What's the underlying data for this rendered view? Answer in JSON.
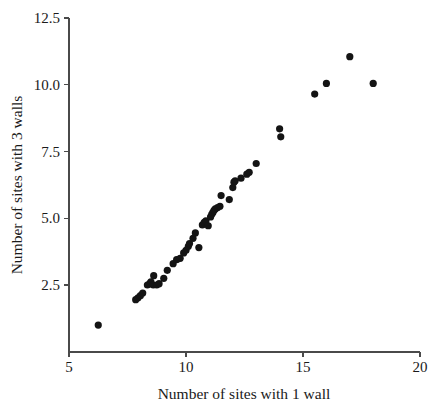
{
  "chart_data": {
    "type": "scatter",
    "title": "",
    "xlabel": "Number of sites with 1 wall",
    "ylabel": "Number of sites with 3 walls",
    "xlim": [
      5,
      20
    ],
    "ylim": [
      1.0,
      12.5
    ],
    "xticks": [
      5,
      10,
      15,
      20
    ],
    "xtick_labels": [
      "5",
      "10",
      "15",
      "20"
    ],
    "yticks": [
      2.5,
      5.0,
      7.5,
      10.0,
      12.5
    ],
    "ytick_labels": [
      "2.5",
      "5.0",
      "7.5",
      "10.0",
      "12.5"
    ],
    "grid": false,
    "legend": null,
    "marker": "filled-circle",
    "marker_color": "#141414",
    "marker_size": 5.2,
    "n_points": 52,
    "points": [
      [
        6.25,
        1.0
      ],
      [
        7.85,
        1.95
      ],
      [
        7.95,
        2.02
      ],
      [
        8.05,
        2.1
      ],
      [
        8.15,
        2.2
      ],
      [
        8.35,
        2.5
      ],
      [
        8.45,
        2.55
      ],
      [
        8.5,
        2.62
      ],
      [
        8.6,
        2.5
      ],
      [
        8.62,
        2.85
      ],
      [
        8.75,
        2.5
      ],
      [
        8.85,
        2.55
      ],
      [
        9.05,
        2.75
      ],
      [
        9.2,
        3.05
      ],
      [
        9.45,
        3.3
      ],
      [
        9.6,
        3.45
      ],
      [
        9.75,
        3.5
      ],
      [
        9.9,
        3.7
      ],
      [
        10.0,
        3.8
      ],
      [
        10.1,
        3.95
      ],
      [
        10.15,
        4.05
      ],
      [
        10.3,
        4.25
      ],
      [
        10.4,
        4.45
      ],
      [
        10.55,
        3.9
      ],
      [
        10.7,
        4.75
      ],
      [
        10.78,
        4.85
      ],
      [
        10.85,
        4.9
      ],
      [
        10.95,
        4.72
      ],
      [
        11.05,
        5.05
      ],
      [
        11.1,
        5.15
      ],
      [
        11.15,
        5.22
      ],
      [
        11.2,
        5.3
      ],
      [
        11.25,
        5.35
      ],
      [
        11.35,
        5.4
      ],
      [
        11.45,
        5.45
      ],
      [
        11.5,
        5.85
      ],
      [
        11.85,
        5.7
      ],
      [
        12.0,
        6.15
      ],
      [
        12.05,
        6.35
      ],
      [
        12.1,
        6.4
      ],
      [
        12.35,
        6.5
      ],
      [
        12.6,
        6.65
      ],
      [
        12.7,
        6.72
      ],
      [
        13.0,
        7.05
      ],
      [
        14.0,
        8.35
      ],
      [
        14.05,
        8.05
      ],
      [
        15.5,
        9.65
      ],
      [
        16.0,
        10.05
      ],
      [
        17.0,
        11.05
      ],
      [
        18.0,
        10.05
      ]
    ],
    "axis_geometry": {
      "x_origin_px": 69,
      "y_origin_px": 352,
      "x_px_per_unit": 23.4,
      "y_px_per_unit": 26.7,
      "y_ref_value": 2.5,
      "y_ref_px": 285
    }
  }
}
